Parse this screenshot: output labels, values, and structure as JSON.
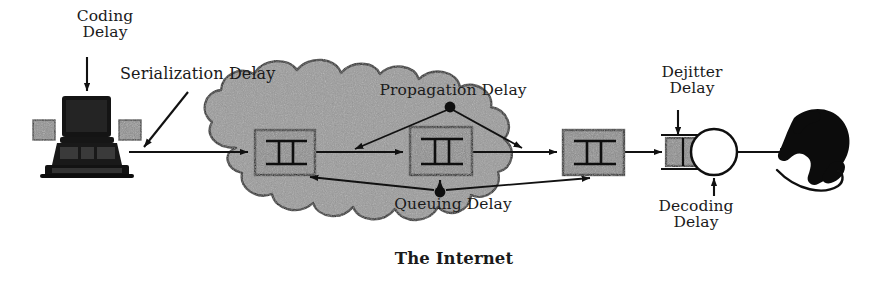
{
  "figure": {
    "background_color": "#ffffff",
    "cloud_fill": "#9a9a9a",
    "router_fill": "#8c8c8c",
    "line_color": "#111111",
    "text_color": "#1a1a1a"
  },
  "labels": {
    "coding_delay": "Coding\nDelay",
    "serialization_delay": "Serialization Delay",
    "propagation_delay": "Propagation Delay",
    "queuing_delay": "Queuing Delay",
    "the_internet": "The Internet",
    "dejitter_delay": "Dejitter\nDelay",
    "decoding_delay": "Decoding\nDelay"
  },
  "nodes": {
    "sender_workstation": {
      "name": "workstation",
      "description": "black desktop computer with monitor and keyboard"
    },
    "routers": [
      {
        "id": "router-1",
        "symbol": "II"
      },
      {
        "id": "router-2",
        "symbol": "II"
      },
      {
        "id": "router-3",
        "symbol": "II"
      }
    ],
    "dejitter_buffer": {
      "name": "dejitter-buffer",
      "cells": 2
    },
    "decoder": {
      "name": "decoder-circle",
      "shape": "circle"
    },
    "receiver_handset": {
      "name": "telephone-handset",
      "description": "black telephone handset with cord"
    }
  },
  "annotations": {
    "coding_arrow": "arrow pointing down to workstation monitor",
    "serialization_arrow": "arrow pointing down-left to sender link",
    "propagation_arrows": "two arrows from dot to inter-router links",
    "queuing_arrows": "three arrows from dot to router bottoms",
    "dejitter_arrow": "arrow pointing down to dejitter buffer",
    "decoding_arrow": "arrow pointing up to decoder circle"
  }
}
